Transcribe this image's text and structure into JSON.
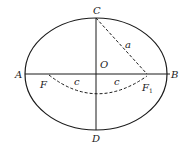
{
  "diagram": {
    "type": "ellipse-geometry",
    "colors": {
      "stroke": "#1a1a1a",
      "background": "#ffffff"
    },
    "labels": {
      "top_vertex": "C",
      "bottom_vertex": "D",
      "left_vertex": "A",
      "right_vertex": "B",
      "center": "O",
      "focus_left": "F",
      "focus_right": "F",
      "focus_right_subscript": "1",
      "semi_major": "a",
      "focal_left": "c",
      "focal_right": "c"
    }
  }
}
